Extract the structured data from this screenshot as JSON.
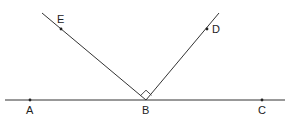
{
  "diagram": {
    "title": "",
    "line_color": "#333333",
    "points": {
      "A": {
        "label": "A",
        "x": 30,
        "y": 100
      },
      "B": {
        "label": "B",
        "x": 146,
        "y": 100
      },
      "C": {
        "label": "C",
        "x": 262,
        "y": 100
      },
      "D": {
        "label": "D",
        "x": 207,
        "y": 29
      },
      "E": {
        "label": "E",
        "x": 61,
        "y": 29
      }
    },
    "segments": [
      {
        "name": "line-AC",
        "from": [
          5,
          100
        ],
        "to": [
          285,
          100
        ]
      },
      {
        "name": "ray-BE",
        "from": [
          146,
          100
        ],
        "to": [
          42,
          13
        ]
      },
      {
        "name": "ray-BD",
        "from": [
          146,
          100
        ],
        "to": [
          219,
          13
        ]
      }
    ],
    "right_angle": {
      "at": "B",
      "between": [
        "E",
        "D"
      ]
    }
  }
}
